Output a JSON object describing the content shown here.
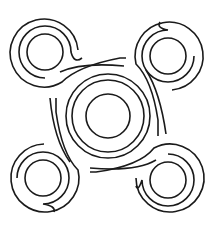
{
  "figure": {
    "description": "Line-art symbol: central concentric circles surrounded by four spiral arms, each ending in a small circle",
    "stroke_color": "#1a1a1a",
    "background_color": "#ffffff",
    "center": {
      "x": 108,
      "y": 116
    },
    "center_circle_radii": [
      22,
      36,
      42
    ],
    "corner_circles": [
      {
        "name": "top-left",
        "x": 45,
        "y": 52,
        "r": 18
      },
      {
        "name": "top-right",
        "x": 168,
        "y": 56,
        "r": 18
      },
      {
        "name": "bottom-left",
        "x": 43,
        "y": 178,
        "r": 18
      },
      {
        "name": "bottom-right",
        "x": 168,
        "y": 180,
        "r": 18
      }
    ]
  }
}
